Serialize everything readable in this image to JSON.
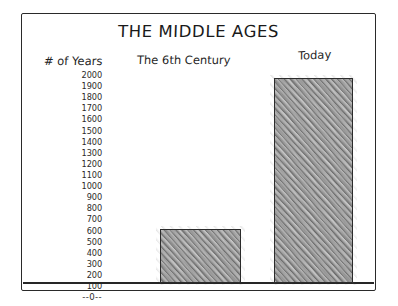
{
  "chart": {
    "title": "THE MIDDLE AGES",
    "y_axis_label": "# of Years",
    "zero_label": "--0--",
    "categories": [
      "The 6th Century",
      "Today"
    ],
    "y_ticks": [
      "2000",
      "1900",
      "1800",
      "1700",
      "1600",
      "1500",
      "1400",
      "1300",
      "1200",
      "1100",
      "1000",
      "900",
      "800",
      "700",
      "600",
      "500",
      "400",
      "300",
      "200",
      "100"
    ],
    "bar_color": "#cdcdcd",
    "outline_color": "#2b2b2b"
  },
  "chart_data": {
    "type": "bar",
    "title": "THE MIDDLE AGES",
    "xlabel": "",
    "ylabel": "# of Years",
    "categories": [
      "The 6th Century",
      "Today"
    ],
    "values": [
      500,
      2000
    ],
    "ylim": [
      0,
      2000
    ],
    "yticks": [
      0,
      100,
      200,
      300,
      400,
      500,
      600,
      700,
      800,
      900,
      1000,
      1100,
      1200,
      1300,
      1400,
      1500,
      1600,
      1700,
      1800,
      1900,
      2000
    ],
    "grid": false,
    "legend": false,
    "style": "hand-drawn pencil sketch"
  }
}
